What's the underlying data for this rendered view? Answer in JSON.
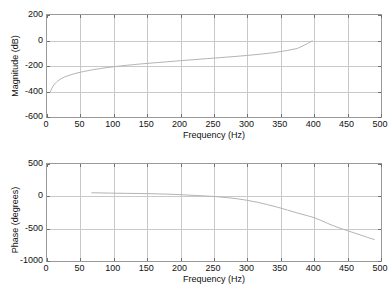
{
  "figure": {
    "background_color": "#ffffff",
    "axis_color": "#9a9a9a",
    "grid_color": "#c9c9c9",
    "curve_color": "#b4b4b4",
    "text_color": "#111111"
  },
  "chart_data": [
    {
      "type": "line",
      "id": "magnitude",
      "title": "",
      "xlabel": "Frequency (Hz)",
      "ylabel": "Magnitude (dB)",
      "xlim": [
        0,
        500
      ],
      "ylim": [
        -600,
        200
      ],
      "xticks": [
        0,
        50,
        100,
        150,
        200,
        250,
        300,
        350,
        400,
        450,
        500
      ],
      "xticklabels": [
        "0",
        "50",
        "100",
        "150",
        "200",
        "250",
        "300",
        "350",
        "400",
        "450",
        "500"
      ],
      "yticks": [
        -600,
        -400,
        -200,
        0,
        200
      ],
      "yticklabels": [
        "-600",
        "-400",
        "-200",
        "0",
        "200"
      ],
      "grid": true,
      "legend": null,
      "series": [
        {
          "name": "magnitude",
          "x": [
            5,
            7,
            9,
            12,
            15,
            18,
            22,
            26,
            30,
            35,
            40,
            45,
            50,
            55,
            60,
            65,
            70,
            80,
            90,
            100,
            110,
            120,
            130,
            140,
            150,
            165,
            180,
            200,
            220,
            240,
            260,
            280,
            300,
            320,
            340,
            360,
            375,
            390,
            397
          ],
          "y": [
            -404,
            -378,
            -358,
            -338,
            -322,
            -310,
            -297,
            -287,
            -279,
            -270,
            -262,
            -255,
            -249,
            -243,
            -238,
            -233,
            -228,
            -220,
            -212,
            -206,
            -200,
            -194,
            -189,
            -184,
            -180,
            -173,
            -167,
            -158,
            -150,
            -142,
            -134,
            -126,
            -117,
            -107,
            -95,
            -78,
            -62,
            -24,
            -3
          ]
        }
      ]
    },
    {
      "type": "line",
      "id": "phase",
      "title": "",
      "xlabel": "Frequency (Hz)",
      "ylabel": "Phase (degrees)",
      "xlim": [
        0,
        500
      ],
      "ylim": [
        -1000,
        500
      ],
      "xticks": [
        0,
        50,
        100,
        150,
        200,
        250,
        300,
        350,
        400,
        450,
        500
      ],
      "xticklabels": [
        "0",
        "50",
        "100",
        "150",
        "200",
        "250",
        "300",
        "350",
        "400",
        "450",
        "500"
      ],
      "yticks": [
        -1000,
        -500,
        0,
        500
      ],
      "yticklabels": [
        "-1000",
        "-500",
        "0",
        "500"
      ],
      "grid": true,
      "legend": null,
      "series": [
        {
          "name": "phase",
          "x": [
            67,
            75,
            85,
            95,
            105,
            120,
            135,
            150,
            165,
            180,
            195,
            210,
            225,
            240,
            255,
            270,
            285,
            300,
            315,
            330,
            345,
            360,
            375,
            390,
            400,
            410,
            420,
            430,
            440,
            450,
            460,
            470,
            480,
            490
          ],
          "y": [
            55,
            54,
            52,
            50,
            48,
            46,
            44,
            42,
            38,
            34,
            28,
            20,
            12,
            4,
            -6,
            -20,
            -38,
            -62,
            -92,
            -128,
            -168,
            -212,
            -258,
            -300,
            -330,
            -372,
            -418,
            -460,
            -498,
            -532,
            -566,
            -600,
            -636,
            -668
          ]
        }
      ]
    }
  ]
}
